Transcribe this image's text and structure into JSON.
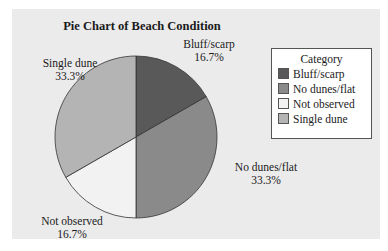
{
  "chart_data": {
    "type": "pie",
    "title": "Pie Chart of Beach Condition",
    "categories": [
      "Bluff/scarp",
      "No dunes/flat",
      "Not observed",
      "Single dune"
    ],
    "values": [
      16.7,
      33.3,
      16.7,
      33.3
    ],
    "unit": "%",
    "colors": [
      "#595959",
      "#8a8a8a",
      "#f2f2f2",
      "#b4b4b4"
    ],
    "slice_labels": [
      {
        "name": "Bluff/scarp",
        "pct": "16.7%"
      },
      {
        "name": "No dunes/flat",
        "pct": "33.3%"
      },
      {
        "name": "Not observed",
        "pct": "16.7%"
      },
      {
        "name": "Single dune",
        "pct": "33.3%"
      }
    ],
    "legend": {
      "title": "Category",
      "position": "right",
      "items": [
        "Bluff/scarp",
        "No dunes/flat",
        "Not observed",
        "Single dune"
      ]
    },
    "start_angle": "12 o'clock, clockwise"
  }
}
